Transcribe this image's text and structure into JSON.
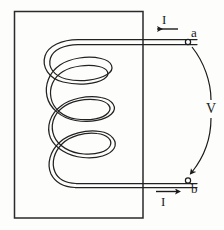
{
  "figure": {
    "kind": "inductor-coil-diagram",
    "background_color": "#fdfdfc",
    "ink_color": "#1a1a1a"
  },
  "core": {
    "name": "rectangular-core",
    "x": 14,
    "y": 11,
    "width": 129,
    "height": 207,
    "stroke_color": "#2a2a2a"
  },
  "coil": {
    "turns": 3,
    "stroke_color": "#222222",
    "tube_style": "double-line"
  },
  "leads": {
    "top": {
      "label": "a",
      "terminal_shape": "open-circle",
      "y": 42
    },
    "bottom": {
      "label": "b",
      "terminal_shape": "open-circle",
      "y": 180
    }
  },
  "labels": {
    "terminal_a": "a",
    "terminal_b": "b",
    "current_top": "I",
    "current_bottom": "I",
    "voltage": "V"
  },
  "arrows": {
    "current_top": {
      "name": "current-arrow-top",
      "direction": "left",
      "x1": 178,
      "x2": 156,
      "y": 29
    },
    "current_bottom": {
      "name": "current-arrow-bottom",
      "direction": "right",
      "x1": 156,
      "x2": 178,
      "y": 192
    },
    "voltage_arc": {
      "name": "voltage-arc-arrow",
      "direction": "down",
      "from": "a",
      "to": "b"
    }
  }
}
